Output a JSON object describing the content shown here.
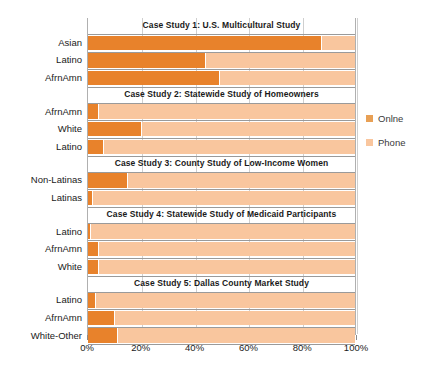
{
  "chart_data": {
    "type": "bar",
    "subtype": "stacked-horizontal-100pct",
    "title": "",
    "xlabel": "",
    "ylabel": "",
    "xlim": [
      0,
      100
    ],
    "xticks": [
      "0%",
      "20%",
      "40%",
      "60%",
      "80%",
      "100%"
    ],
    "xtick_values": [
      0,
      20,
      40,
      60,
      80,
      100
    ],
    "grid": true,
    "legend_position": "right",
    "series_names": [
      "Online",
      "Phone"
    ],
    "colors": {
      "online": "#E8822B",
      "phone": "#F9C69E",
      "grid": "#cfcfcf",
      "border": "#b0b0b0",
      "text": "#1a1a1a"
    },
    "panels": [
      {
        "title": "Case Study 1: U.S. Multicultural Study",
        "categories": [
          "Asian",
          "Latino",
          "AfrnAmn"
        ],
        "series": [
          {
            "name": "Online",
            "values": [
              87,
              44,
              49
            ]
          },
          {
            "name": "Phone",
            "values": [
              13,
              56,
              51
            ]
          }
        ]
      },
      {
        "title": "Case Study 2: Statewide Study of Homeowners",
        "categories": [
          "AfrnAmn",
          "White",
          "Latino"
        ],
        "series": [
          {
            "name": "Online",
            "values": [
              4,
              20,
              6
            ]
          },
          {
            "name": "Phone",
            "values": [
              96,
              80,
              94
            ]
          }
        ]
      },
      {
        "title": "Case Study 3:  County Study of Low-Income Women",
        "categories": [
          "Non-Latinas",
          "Latinas"
        ],
        "series": [
          {
            "name": "Online",
            "values": [
              15,
              2
            ]
          },
          {
            "name": "Phone",
            "values": [
              85,
              98
            ]
          }
        ]
      },
      {
        "title": "Case Study 4: Statewide Study of Medicaid Participants",
        "categories": [
          "Latino",
          "AfrnAmn",
          "White"
        ],
        "series": [
          {
            "name": "Online",
            "values": [
              1,
              4,
              4
            ]
          },
          {
            "name": "Phone",
            "values": [
              99,
              96,
              96
            ]
          }
        ]
      },
      {
        "title": "Case Study 5:  Dallas County Market Study",
        "categories": [
          "Latino",
          "AfrnAmn",
          "White-Other"
        ],
        "series": [
          {
            "name": "Online",
            "values": [
              3,
              10,
              11
            ]
          },
          {
            "name": "Phone",
            "values": [
              97,
              90,
              89
            ]
          }
        ]
      }
    ]
  },
  "legend": {
    "items": [
      {
        "label": "Onlne",
        "color": "#E8A055"
      },
      {
        "label": "Phone",
        "color": "#F9C69E"
      }
    ]
  }
}
